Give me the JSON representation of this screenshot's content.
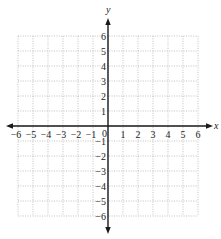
{
  "diagram": {
    "type": "coordinate-plane",
    "x_axis_label": "x",
    "y_axis_label": "y",
    "x_range": [
      -6,
      6
    ],
    "y_range": [
      -6,
      6
    ],
    "grid": true,
    "grid_style": "dotted",
    "origin_label": "0",
    "x_ticks": [
      "-6",
      "-5",
      "-4",
      "-3",
      "-2",
      "-1",
      "1",
      "2",
      "3",
      "4",
      "5",
      "6"
    ],
    "y_ticks": [
      "6",
      "5",
      "4",
      "3",
      "2",
      "1",
      "-1",
      "-2",
      "-3",
      "-4",
      "-5",
      "-6"
    ],
    "colors": {
      "axis": "#1a1a1a",
      "grid": "#a8a8a8",
      "background": "#ffffff"
    }
  }
}
